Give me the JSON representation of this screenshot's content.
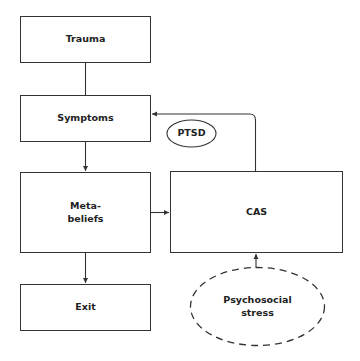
{
  "diagram": {
    "nodes": {
      "trauma": {
        "label": "Trauma"
      },
      "symptoms": {
        "label": "Symptoms"
      },
      "meta_beliefs": {
        "label_line1": "Meta-",
        "label_line2": "beliefs"
      },
      "exit": {
        "label": "Exit"
      },
      "cas": {
        "label": "CAS"
      },
      "ptsd": {
        "label": "PTSD"
      },
      "psychosocial_stress": {
        "label_line1": "Psychosocial",
        "label_line2": "stress"
      }
    },
    "edges": [
      {
        "from": "Trauma",
        "to": "Symptoms",
        "arrow": false
      },
      {
        "from": "Symptoms",
        "to": "Meta-beliefs",
        "arrow": true
      },
      {
        "from": "Meta-beliefs",
        "to": "Exit",
        "arrow": true
      },
      {
        "from": "Meta-beliefs",
        "to": "CAS",
        "arrow": true
      },
      {
        "from": "CAS",
        "to": "Symptoms",
        "arrow": true
      },
      {
        "from": "Psychosocial stress",
        "to": "CAS",
        "arrow": true
      }
    ],
    "colors": {
      "stroke": "#333333",
      "text": "#222222",
      "background": "#ffffff"
    }
  }
}
